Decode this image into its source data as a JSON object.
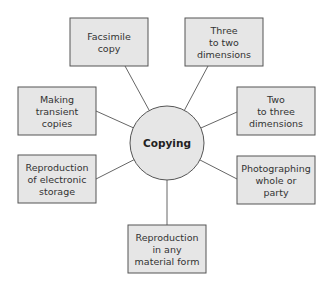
{
  "diagram": {
    "type": "mind-map",
    "center": {
      "label": "Copying"
    },
    "colors": {
      "fill": "#e6e6e6",
      "stroke": "#555555",
      "line": "#666666",
      "text": "#333333"
    },
    "nodes": [
      {
        "id": "facsimile",
        "lines": [
          "Facsimile",
          "copy"
        ]
      },
      {
        "id": "three-to-two",
        "lines": [
          "Three",
          "to two",
          "dimensions"
        ]
      },
      {
        "id": "transient",
        "lines": [
          "Making",
          "transient",
          "copies"
        ]
      },
      {
        "id": "two-to-three",
        "lines": [
          "Two",
          "to three",
          "dimensions"
        ]
      },
      {
        "id": "electronic",
        "lines": [
          "Reproduction",
          "of electronic",
          "storage"
        ]
      },
      {
        "id": "photographing",
        "lines": [
          "Photographing",
          "whole or",
          "party"
        ]
      },
      {
        "id": "material",
        "lines": [
          "Reproduction",
          "in any",
          "material form"
        ]
      }
    ]
  }
}
